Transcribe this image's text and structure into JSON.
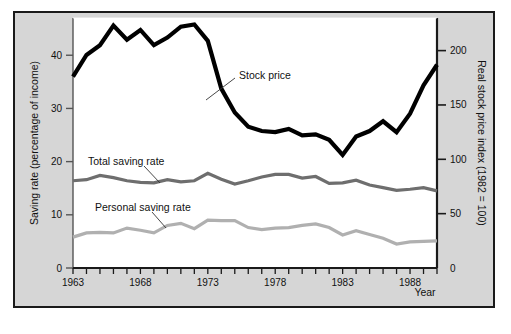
{
  "figure": {
    "background_color": "#d6d6d6",
    "plot_background_color": "#ffffff",
    "frame_color": "#1a1a1a"
  },
  "chart_data": {
    "type": "line",
    "title": "",
    "xlabel": "Year",
    "ylabel": "Saving rate (percentage of income)",
    "y2label": "Real stock price index (1982 = 100)",
    "xlim": [
      1963,
      1990
    ],
    "ylim": [
      0,
      47
    ],
    "y2lim": [
      0,
      230
    ],
    "grid": false,
    "legend": "inline-annotations",
    "xticks": [
      1963,
      1968,
      1973,
      1978,
      1983,
      1988
    ],
    "xtick_labels": [
      "1963",
      "1968",
      "1973",
      "1978",
      "1983",
      "1988"
    ],
    "xtick_minor_every": 1,
    "yticks": [
      0,
      10,
      20,
      30,
      40
    ],
    "ytick_labels": [
      "0",
      "10",
      "20",
      "30",
      "40"
    ],
    "y2ticks": [
      0,
      50,
      100,
      150,
      200
    ],
    "y2tick_labels": [
      "0",
      "50",
      "100",
      "150",
      "200"
    ],
    "x": [
      1963,
      1964,
      1965,
      1966,
      1967,
      1968,
      1969,
      1970,
      1971,
      1972,
      1973,
      1974,
      1975,
      1976,
      1977,
      1978,
      1979,
      1980,
      1981,
      1982,
      1983,
      1984,
      1985,
      1986,
      1987,
      1988,
      1989,
      1990
    ],
    "series": [
      {
        "name": "Stock price",
        "axis": "right",
        "color": "#000000",
        "width": 4.2,
        "label_text": "Stock price",
        "values": [
          176,
          196,
          205,
          223,
          210,
          219,
          205,
          212,
          222,
          224,
          209,
          165,
          143,
          130,
          126,
          125,
          128,
          122,
          123,
          118,
          104,
          121,
          126,
          135,
          125,
          142,
          168,
          187
        ]
      },
      {
        "name": "Total saving rate",
        "axis": "left",
        "color": "#6e6e6e",
        "width": 3.2,
        "label_text": "Total saving rate",
        "values": [
          16.4,
          16.6,
          17.4,
          17.0,
          16.4,
          16.1,
          16.0,
          16.6,
          16.2,
          16.4,
          17.8,
          16.7,
          15.8,
          16.4,
          17.1,
          17.6,
          17.6,
          16.9,
          17.2,
          15.9,
          16.0,
          16.5,
          15.6,
          15.1,
          14.6,
          14.8,
          15.1,
          14.5
        ]
      },
      {
        "name": "Personal saving rate",
        "axis": "left",
        "color": "#b0b0b0",
        "width": 3.2,
        "label_text": "Personal saving rate",
        "values": [
          5.8,
          6.6,
          6.7,
          6.6,
          7.5,
          7.1,
          6.6,
          8.0,
          8.4,
          7.4,
          9.0,
          8.9,
          8.9,
          7.6,
          7.2,
          7.5,
          7.6,
          8.0,
          8.3,
          7.6,
          6.2,
          7.0,
          6.3,
          5.6,
          4.5,
          4.9,
          5.0,
          5.1
        ]
      }
    ],
    "annotations": [
      {
        "name": "stock-price-label",
        "text": "Stock price",
        "x_px": 238,
        "y_px": 75
      },
      {
        "name": "total-saving-rate-label",
        "text": "Total saving rate",
        "x_px": 88,
        "y_px": 161
      },
      {
        "name": "personal-saving-rate-label",
        "text": "Personal saving rate",
        "x_px": 95,
        "y_px": 207
      }
    ]
  }
}
